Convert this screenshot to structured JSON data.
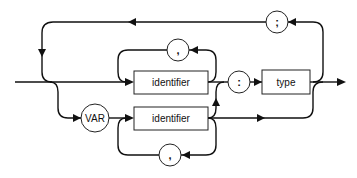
{
  "diagram": {
    "type": "syntax-railroad-diagram",
    "nodes": {
      "separator_top": ";",
      "comma_upper": ",",
      "identifier_upper": "identifier",
      "colon": ":",
      "type": "type",
      "var_keyword": "VAR",
      "identifier_lower": "identifier",
      "comma_lower": ","
    },
    "colors": {
      "line": "#111111",
      "background": "#ffffff"
    }
  }
}
